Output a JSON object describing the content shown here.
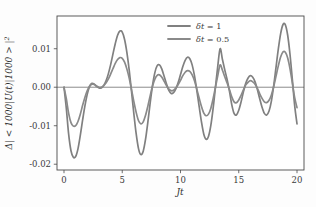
{
  "chart_data": {
    "type": "line",
    "title": "",
    "xlabel": "Jt",
    "ylabel": "Δ| < 1000|U(t)|1000 > |²",
    "ylabel_parts": {
      "delta": "Δ",
      "body": "| < 1000|U(t)|1000 > |",
      "exponent": "2"
    },
    "xlim": [
      -0.6,
      20.6
    ],
    "ylim": [
      -0.0215,
      0.0185
    ],
    "xticks": [
      0,
      5,
      10,
      15,
      20
    ],
    "xtick_labels": [
      "0",
      "5",
      "10",
      "15",
      "20"
    ],
    "yticks": [
      0.01,
      0.0,
      -0.01,
      -0.02
    ],
    "ytick_labels": [
      "0.01",
      "0.00",
      "-0.01",
      "-0.02"
    ],
    "grid": false,
    "zero_line": true,
    "legend_position": "top-center",
    "colors": {
      "series_1": "#808080",
      "series_2": "#8a8a8a",
      "frame": "#4a4a4a",
      "zero_line": "#5a5a5a",
      "background": "#fdfdfd",
      "text": "#3a3a3a"
    },
    "series": [
      {
        "name": "δt = 1",
        "label_parts": {
          "symbol": "δt",
          "equals": "=",
          "value": "1"
        },
        "color": "#808080",
        "x": [
          0.0,
          0.2,
          0.4,
          0.6,
          0.8,
          1.0,
          1.2,
          1.4,
          1.6,
          1.8,
          2.0,
          2.2,
          2.4,
          2.6,
          2.8,
          3.0,
          3.2,
          3.4,
          3.6,
          3.8,
          4.0,
          4.2,
          4.4,
          4.6,
          4.8,
          5.0,
          5.2,
          5.4,
          5.6,
          5.8,
          6.0,
          6.2,
          6.4,
          6.6,
          6.8,
          7.0,
          7.2,
          7.4,
          7.6,
          7.8,
          8.0,
          8.2,
          8.4,
          8.6,
          8.8,
          9.0,
          9.2,
          9.4,
          9.6,
          9.8,
          10.0,
          10.2,
          10.4,
          10.6,
          10.8,
          11.0,
          11.2,
          11.4,
          11.6,
          11.8,
          12.0,
          12.2,
          12.4,
          12.6,
          12.8,
          13.0,
          13.2,
          13.4,
          13.6,
          13.8,
          14.0,
          14.2,
          14.4,
          14.6,
          14.8,
          15.0,
          15.2,
          15.4,
          15.6,
          15.8,
          16.0,
          16.2,
          16.4,
          16.6,
          16.8,
          17.0,
          17.2,
          17.4,
          17.6,
          17.8,
          18.0,
          18.2,
          18.4,
          18.6,
          18.8,
          19.0,
          19.2,
          19.4,
          19.6,
          19.8,
          20.0
        ],
        "y": [
          0.0,
          -0.0055,
          -0.0122,
          -0.0165,
          -0.0182,
          -0.018,
          -0.016,
          -0.0125,
          -0.0085,
          -0.0048,
          -0.0018,
          0.0002,
          0.001,
          0.0008,
          0.0002,
          -0.0002,
          -0.0002,
          0.0004,
          0.0016,
          0.0034,
          0.0058,
          0.0086,
          0.0113,
          0.0135,
          0.0146,
          0.0143,
          0.0124,
          0.009,
          0.0044,
          -0.0012,
          -0.007,
          -0.0122,
          -0.016,
          -0.0175,
          -0.0166,
          -0.0135,
          -0.009,
          -0.004,
          0.0005,
          0.0038,
          0.0056,
          0.0058,
          0.0047,
          0.0028,
          0.0008,
          -0.0008,
          -0.0016,
          -0.0014,
          -0.0004,
          0.0012,
          0.0033,
          0.0054,
          0.007,
          0.0078,
          0.0074,
          0.0058,
          0.003,
          -0.0008,
          -0.005,
          -0.009,
          -0.0122,
          -0.0135,
          -0.0128,
          -0.01,
          -0.0055,
          0.0,
          0.0055,
          0.01,
          0.0072,
          0.0045,
          0.002,
          -0.001,
          -0.0045,
          -0.0068,
          -0.0072,
          -0.006,
          -0.0038,
          -0.0012,
          0.001,
          0.0024,
          0.003,
          0.0026,
          0.0014,
          -0.0006,
          -0.003,
          -0.0052,
          -0.0068,
          -0.0072,
          -0.0062,
          -0.0036,
          0.0004,
          0.0052,
          0.01,
          0.014,
          0.0163,
          0.0162,
          0.0135,
          0.0085,
          0.002,
          -0.0048,
          -0.0095
        ]
      },
      {
        "name": "δt = 0.5",
        "label_parts": {
          "symbol": "δt",
          "equals": "=",
          "value": "0.5"
        },
        "color": "#8a8a8a",
        "x": [
          0.0,
          0.2,
          0.4,
          0.6,
          0.8,
          1.0,
          1.2,
          1.4,
          1.6,
          1.8,
          2.0,
          2.2,
          2.4,
          2.6,
          2.8,
          3.0,
          3.2,
          3.4,
          3.6,
          3.8,
          4.0,
          4.2,
          4.4,
          4.6,
          4.8,
          5.0,
          5.2,
          5.4,
          5.6,
          5.8,
          6.0,
          6.2,
          6.4,
          6.6,
          6.8,
          7.0,
          7.2,
          7.4,
          7.6,
          7.8,
          8.0,
          8.2,
          8.4,
          8.6,
          8.8,
          9.0,
          9.2,
          9.4,
          9.6,
          9.8,
          10.0,
          10.2,
          10.4,
          10.6,
          10.8,
          11.0,
          11.2,
          11.4,
          11.6,
          11.8,
          12.0,
          12.2,
          12.4,
          12.6,
          12.8,
          13.0,
          13.2,
          13.4,
          13.6,
          13.8,
          14.0,
          14.2,
          14.4,
          14.6,
          14.8,
          15.0,
          15.2,
          15.4,
          15.6,
          15.8,
          16.0,
          16.2,
          16.4,
          16.6,
          16.8,
          17.0,
          17.2,
          17.4,
          17.6,
          17.8,
          18.0,
          18.2,
          18.4,
          18.6,
          18.8,
          19.0,
          19.2,
          19.4,
          19.6,
          19.8,
          20.0
        ],
        "y": [
          0.0,
          -0.003,
          -0.0068,
          -0.0092,
          -0.0101,
          -0.01,
          -0.0089,
          -0.007,
          -0.0047,
          -0.0026,
          -0.0009,
          0.0003,
          0.0008,
          0.0007,
          0.0003,
          0.0,
          0.0,
          0.0004,
          0.0011,
          0.0021,
          0.0034,
          0.0048,
          0.0062,
          0.0072,
          0.0077,
          0.0075,
          0.0065,
          0.0047,
          0.0023,
          -0.0007,
          -0.0038,
          -0.0066,
          -0.0087,
          -0.0095,
          -0.009,
          -0.0073,
          -0.0049,
          -0.0022,
          0.0003,
          0.0021,
          0.0031,
          0.0032,
          0.0026,
          0.0015,
          0.0004,
          -0.0005,
          -0.0009,
          -0.0008,
          -0.0002,
          0.0007,
          0.0018,
          0.003,
          0.0039,
          0.0043,
          0.0041,
          0.0032,
          0.0017,
          -0.0005,
          -0.0028,
          -0.005,
          -0.0067,
          -0.0074,
          -0.007,
          -0.0055,
          -0.003,
          0.0,
          0.003,
          0.0058,
          0.0044,
          0.0027,
          0.0011,
          -0.0006,
          -0.0025,
          -0.0038,
          -0.004,
          -0.0033,
          -0.0021,
          -0.0007,
          0.0006,
          0.0013,
          0.0017,
          0.0014,
          0.0008,
          -0.0003,
          -0.0017,
          -0.0029,
          -0.0038,
          -0.004,
          -0.0034,
          -0.002,
          0.0002,
          0.0029,
          0.0056,
          0.0079,
          0.0092,
          0.0091,
          0.0076,
          0.0048,
          0.0011,
          -0.0027,
          -0.0053
        ]
      }
    ]
  }
}
